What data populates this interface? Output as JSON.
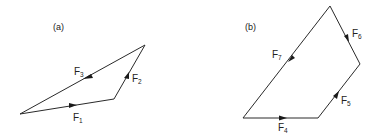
{
  "diagrams": [
    {
      "id": "a",
      "panel_label": "(a)",
      "edges": [
        {
          "name": "F",
          "sub": "1"
        },
        {
          "name": "F",
          "sub": "2"
        },
        {
          "name": "F",
          "sub": "3"
        }
      ]
    },
    {
      "id": "b",
      "panel_label": "(b)",
      "edges": [
        {
          "name": "F",
          "sub": "4"
        },
        {
          "name": "F",
          "sub": "5"
        },
        {
          "name": "F",
          "sub": "6"
        },
        {
          "name": "F",
          "sub": "7"
        }
      ]
    }
  ],
  "colors": {
    "line": "#2a2a2a",
    "text": "#222222",
    "background": "#ffffff"
  }
}
